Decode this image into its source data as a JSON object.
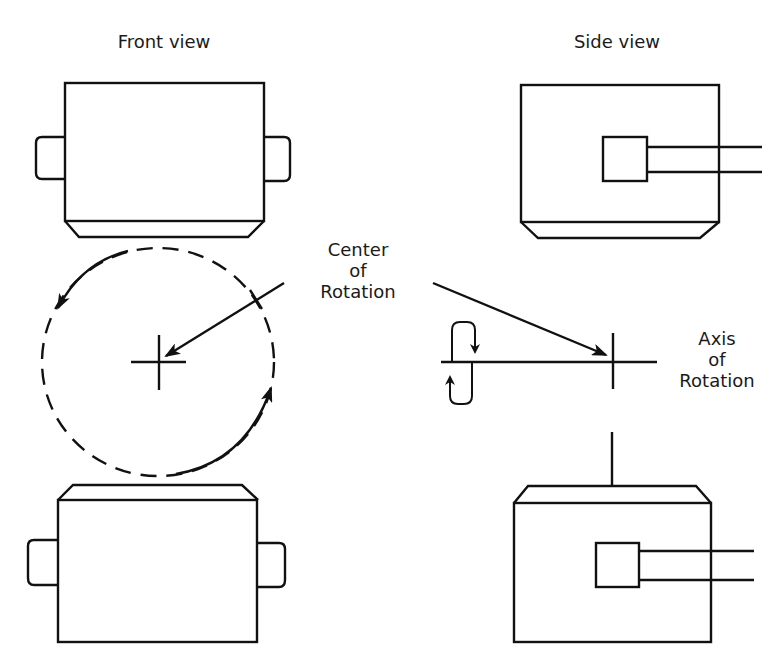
{
  "labels": {
    "front_view": "Front view",
    "side_view": "Side view",
    "center_of_rotation": [
      "Center",
      "of",
      "Rotation"
    ],
    "axis_of_rotation": [
      "Axis",
      "of",
      "Rotation"
    ]
  },
  "colors": {
    "stroke": "#111111",
    "background": "#ffffff",
    "text": "#1a1a1a"
  },
  "figures": {
    "front_top_part": "rectangular body with side tabs and chamfered bottom",
    "front_bottom_part": "rectangular body with side tabs and chamfered top",
    "side_top_part": "rectangular body with square boss and shaft, chamfered bottom",
    "side_bottom_part": "rectangular body with square boss and shaft, chamfered top",
    "rotation_circle": "dashed circle with two curved arrows indicating rotation direction",
    "axis_symbol": "horizontal axis line with curled rotation arrows"
  }
}
